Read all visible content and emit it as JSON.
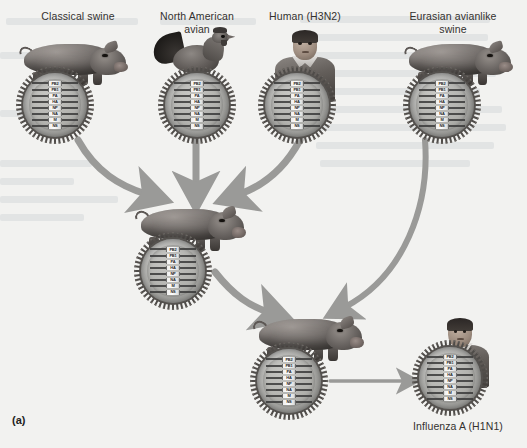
{
  "figure": {
    "panel_tag": "(a)",
    "background_color": "#f2f2f0",
    "arrow_color": "#9a9a98"
  },
  "gene_segments": [
    "PB2",
    "PB1",
    "PA",
    "HA",
    "NP",
    "NA",
    "M",
    "NS"
  ],
  "sources": [
    {
      "id": "classical-swine",
      "label": "Classical swine",
      "animal": "pig"
    },
    {
      "id": "north-american-avian",
      "label": "North American\navian",
      "animal": "rooster"
    },
    {
      "id": "human-h3n2",
      "label": "Human (H3N2)",
      "animal": "human"
    },
    {
      "id": "eurasian-avianlike-swine",
      "label": "Eurasian avianlike\nswine",
      "animal": "pig"
    }
  ],
  "intermediate": {
    "id": "triple-reassortant-swine",
    "label": "",
    "animal": "pig"
  },
  "secondary": {
    "id": "reassortant-swine",
    "label": "",
    "animal": "pig"
  },
  "result": {
    "id": "influenza-a-h1n1",
    "label": "Influenza A (H1N1)",
    "animal": "human"
  }
}
